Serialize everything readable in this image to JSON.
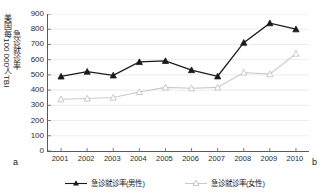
{
  "chart_data": {
    "type": "line",
    "title": "",
    "xlabel": "",
    "ylabel_line1": "美国每100 000人TBI",
    "ylabel_line2": "急诊就诊率",
    "categories": [
      "2001",
      "2002",
      "2003",
      "2004",
      "2005",
      "2006",
      "2007",
      "2008",
      "2009",
      "2010"
    ],
    "x": [
      2001,
      2002,
      2003,
      2004,
      2005,
      2006,
      2007,
      2008,
      2009,
      2010
    ],
    "ylim": [
      0,
      900
    ],
    "yticks": [
      0,
      100,
      200,
      300,
      400,
      500,
      600,
      700,
      800,
      900
    ],
    "grid": true,
    "legend_position": "bottom",
    "series": [
      {
        "name": "急诊就诊率(男性)",
        "color": "#1a1a1a",
        "marker": "triangle-filled",
        "values": [
          490,
          522,
          497,
          585,
          592,
          532,
          491,
          712,
          840,
          800
        ]
      },
      {
        "name": "急诊就诊率(女性)",
        "color": "#c9c9c9",
        "marker": "triangle-open",
        "values": [
          340,
          345,
          351,
          388,
          418,
          412,
          418,
          516,
          505,
          640
        ]
      }
    ],
    "panel_label_left": "a",
    "panel_label_right": "b"
  },
  "legend": {
    "items": [
      {
        "label": "急诊就诊率(男性)"
      },
      {
        "label": "急诊就诊率(女性)"
      }
    ]
  }
}
